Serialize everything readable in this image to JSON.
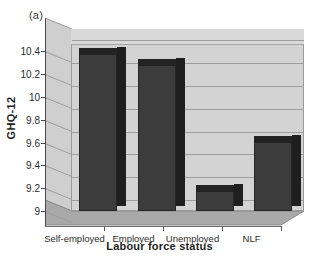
{
  "figure": {
    "panel_label": "(a)"
  },
  "chart_data": {
    "type": "bar",
    "title": "",
    "subtitle": "",
    "xlabel": "Labour force status",
    "ylabel": "GHQ-12",
    "categories": [
      "Self-employed",
      "Employed",
      "Unemployed",
      "NLF"
    ],
    "values": [
      10.43,
      10.33,
      9.23,
      9.66
    ],
    "series": [
      {
        "name": "GHQ-12",
        "values": [
          10.43,
          10.33,
          9.23,
          9.66
        ]
      }
    ],
    "ylim": [
      9,
      10.5
    ],
    "yticks": [
      9,
      9.2,
      9.4,
      9.6,
      9.8,
      10,
      10.2,
      10.4
    ],
    "ytick_labels": [
      "9",
      "9.2",
      "9.4",
      "9.6",
      "9.8",
      "10",
      "10.2",
      "10.4"
    ],
    "grid": true,
    "grid_axis": "y",
    "legend": false,
    "legend_position": "none",
    "three_d": true,
    "annotations": [
      "(a)"
    ],
    "colors": {
      "bar_front": "#3c3c3c",
      "bar_side": "#1f1f1f",
      "bar_top": "#232323",
      "wall": "#d3d3d3",
      "floor": "#a8a8a8",
      "gridline": "#9d9d9d",
      "axis": "#4a4a4a",
      "text": "#1c1c1c",
      "background": "#ffffff"
    }
  }
}
